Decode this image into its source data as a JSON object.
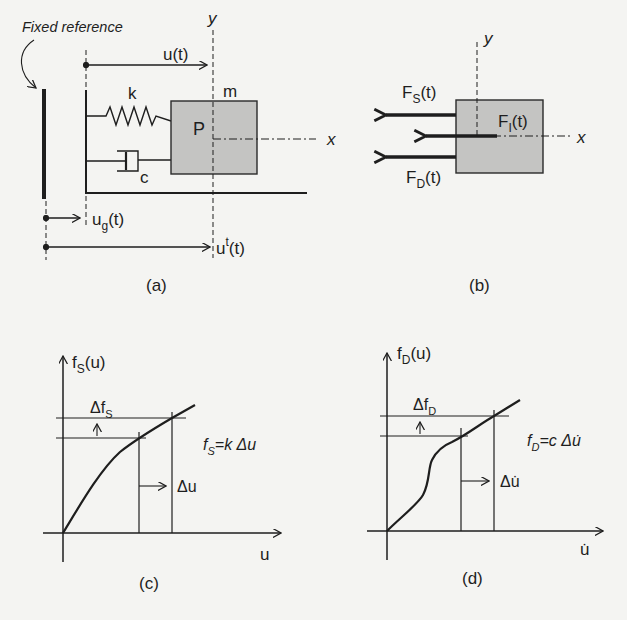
{
  "figure": {
    "panel_a": {
      "caption": "(a)",
      "fixed_reference_label": "Fixed reference",
      "displacement_label": "u(t)",
      "ground_displacement": {
        "base": "u",
        "sub": "g",
        "tail": "(t)"
      },
      "total_displacement": {
        "base": "u",
        "sup": "t",
        "tail": "(t)"
      },
      "spring_label": "k",
      "damper_label": "c",
      "mass_label": "m",
      "point_label": "P",
      "axis_x": "x",
      "axis_y": "y"
    },
    "panel_b": {
      "caption": "(b)",
      "spring_force": {
        "base": "F",
        "sub": "S",
        "tail": "(t)"
      },
      "inertia_force": {
        "base": "F",
        "sub": "I",
        "tail": "(t)"
      },
      "damping_force": {
        "base": "F",
        "sub": "D",
        "tail": "(t)"
      },
      "axis_x": "x",
      "axis_y": "y"
    },
    "panel_c": {
      "caption": "(c)",
      "y_axis_label": {
        "base": "f",
        "sub": "S",
        "tail": "(u)"
      },
      "x_axis_label": "u",
      "delta_f_label": {
        "base": "Δf",
        "sub": "S"
      },
      "delta_x_label": "Δu",
      "relation": {
        "lhs_base": "f",
        "lhs_sub": "S",
        "rhs": "=k Δu"
      }
    },
    "panel_d": {
      "caption": "(d)",
      "y_axis_label": {
        "base": "f",
        "sub": "D",
        "tail": "(u)"
      },
      "x_axis_label": "u̇",
      "delta_f_label": {
        "base": "Δf",
        "sub": "D"
      },
      "delta_x_label": "Δu̇",
      "relation": {
        "lhs_base": "f",
        "lhs_sub": "D",
        "rhs": "=c Δu̇"
      }
    },
    "colors": {
      "ink": "#1e1e1e",
      "mass_fill": "#c4c4c2",
      "background": "#f4f4f2"
    }
  }
}
